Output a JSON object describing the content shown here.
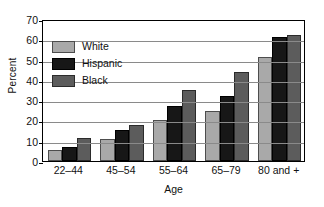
{
  "chart_data": {
    "type": "bar",
    "title": "",
    "xlabel": "Age",
    "ylabel": "Percent",
    "categories": [
      "22–44",
      "45–54",
      "55–64",
      "65–79",
      "80 and +"
    ],
    "series": [
      {
        "name": "White",
        "color": "#a9a9a9",
        "values": [
          5.5,
          11,
          20,
          24.5,
          51.5
        ]
      },
      {
        "name": "Hispanic",
        "color": "#171717",
        "values": [
          7,
          15.5,
          27,
          32,
          61
        ]
      },
      {
        "name": "Black",
        "color": "#5c5c5c",
        "values": [
          11.5,
          18,
          35,
          44,
          62
        ]
      }
    ],
    "ylim": [
      0,
      70
    ],
    "yticks": [
      0,
      10,
      20,
      30,
      40,
      50,
      60,
      70
    ],
    "ytick_labels": [
      "0",
      "10",
      "20",
      "30",
      "40",
      "50",
      "60",
      "70"
    ],
    "grid": "horizontal",
    "legend_position": "upper-left-inside"
  }
}
